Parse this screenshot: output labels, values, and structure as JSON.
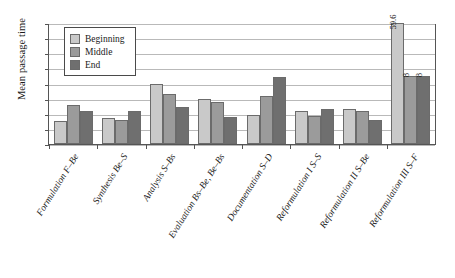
{
  "chart_data": {
    "type": "bar",
    "title": "",
    "xlabel": "",
    "ylabel": "Mean passage time",
    "ylim": [
      -1,
      15
    ],
    "yticks": [
      -1,
      1,
      3,
      5,
      7,
      9,
      11,
      13,
      15
    ],
    "grid": true,
    "legend_position": "top-left",
    "categories": [
      "Formulation F–Be",
      "Synthesis Be–S",
      "Analysis S–Bs",
      "Evaluation Bs–Be, Be–Bs",
      "Documentation S–D",
      "Reformulation I S–S",
      "Reformulation II S–Be",
      "Reformulation III S–F"
    ],
    "series": [
      {
        "name": "Beginning",
        "color": "#c9c9c9",
        "values": [
          2.1,
          2.5,
          7.0,
          4.9,
          2.8,
          3.3,
          3.6,
          59.6
        ],
        "labels": [
          "",
          "",
          "",
          "",
          "",
          "",
          "",
          "59.6"
        ]
      },
      {
        "name": "Middle",
        "color": "#9b9b9b",
        "values": [
          4.2,
          2.2,
          5.6,
          4.6,
          5.4,
          2.7,
          3.3,
          8.0
        ],
        "labels": [
          "",
          "",
          "",
          "",
          "",
          "",
          "",
          "8"
        ]
      },
      {
        "name": "End",
        "color": "#6f6f6f",
        "values": [
          3.3,
          3.3,
          3.9,
          2.6,
          7.8,
          3.6,
          2.2,
          8.0
        ],
        "labels": [
          "",
          "",
          "",
          "",
          "",
          "",
          "",
          "8"
        ]
      }
    ],
    "clipped_bars_note": "Last group bars exceed axis max and are drawn to the top with data labels"
  }
}
